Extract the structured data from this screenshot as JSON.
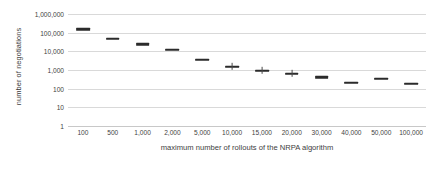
{
  "chart_data": {
    "type": "scatter",
    "title": "",
    "xlabel": "maximum number of rollouts of the NRPA algorithm",
    "ylabel": "number of negotiations",
    "categories": [
      "100",
      "500",
      "1,000",
      "2,000",
      "5,000",
      "10,000",
      "15,000",
      "20,000",
      "30,000",
      "40,000",
      "50,000",
      "100,000"
    ],
    "values": [
      150000,
      48000,
      24000,
      12000,
      3600,
      1500,
      900,
      620,
      400,
      210,
      350,
      180
    ],
    "yticks": [
      "1,000,000",
      "100,000",
      "10,000",
      "1,000",
      "100",
      "10",
      "1"
    ],
    "ytick_values": [
      1000000,
      100000,
      10000,
      1000,
      100,
      10,
      1
    ],
    "ylim": [
      1,
      1000000
    ],
    "yscale": "log",
    "grid": true,
    "legend": "none",
    "series": [
      {
        "name": "number of negotiations",
        "values": [
          150000,
          48000,
          24000,
          12000,
          3600,
          1500,
          900,
          620,
          400,
          210,
          350,
          180
        ]
      }
    ],
    "marker_color": "#2b2b2b",
    "grid_color": "#d9d9d9",
    "background": "#ffffff"
  }
}
